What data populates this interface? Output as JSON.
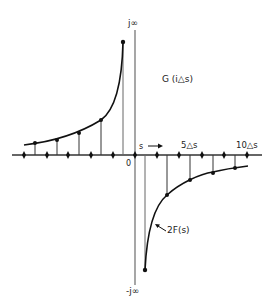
{
  "diagram": {
    "labels": {
      "j_infinity": "j∞",
      "minus_j_infinity": "-j∞",
      "origin": "0",
      "s_arrow": "s",
      "five_delta_s": "5△s",
      "ten_delta_s": "10△s",
      "g_label": "G (i△s)",
      "f_label": "2F(s)"
    },
    "colors": {
      "ink": "#1a1a1a",
      "axis": "#555555",
      "background": "#ffffff"
    }
  }
}
